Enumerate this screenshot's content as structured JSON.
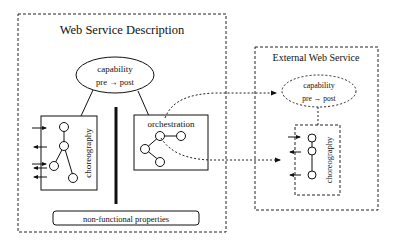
{
  "diagram": {
    "colors": {
      "stroke": "#111111",
      "background": "#ffffff"
    },
    "web_service_description": {
      "title": "Web Service Description",
      "capability": {
        "label": "capability",
        "sublabel": "pre → post"
      },
      "choreography": {
        "label": "choreography"
      },
      "orchestration": {
        "label": "orchestration"
      },
      "non_functional": {
        "label": "non-functional properties"
      }
    },
    "external_web_service": {
      "title": "External Web Service",
      "capability": {
        "label": "capability",
        "sublabel": "pre → post"
      },
      "choreography": {
        "label": "choreography"
      }
    }
  }
}
